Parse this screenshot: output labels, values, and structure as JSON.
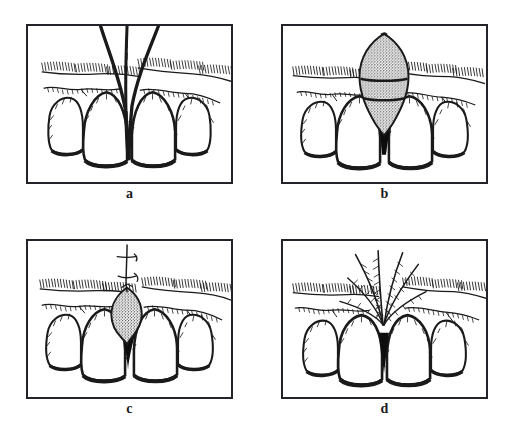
{
  "figure": {
    "background_color": "#ffffff",
    "ink_color": "#1a1a1a",
    "frame_color": "#23232a",
    "stipple_color": "#2b2b2b",
    "layout": "2x2 grid of framed line-drawing panels with bold serif captions below each panel"
  },
  "panels": [
    {
      "caption": "a",
      "name": "panel-a",
      "description": "Front view line drawing of four maxillary anterior teeth with a wide open interdental space between the two central incisors; two bold diverging curved lines mark the black triangle defect; hatched alveolar mucosa bands on both sides above the gingival margins.",
      "stage": "pre-operative open interdental space",
      "features": {
        "teeth_count": 4,
        "graft": false,
        "suture": false,
        "dark_interdental_triangle": true,
        "hatched_mucosa_bands": 2
      }
    },
    {
      "caption": "b",
      "name": "panel-b",
      "description": "A pointed oval stippled connective tissue graft positioned vertically in the interdental space, crossed by two horizontal dark bands dividing it into three segments; a solid black triangle lies at its base between the central incisors; hatched mucosa to the left and right.",
      "stage": "graft harvested and positioned",
      "features": {
        "teeth_count": 4,
        "graft": true,
        "graft_shape": "pointed oval spindle with two horizontal bands",
        "suture": false,
        "dark_interdental_triangle": true,
        "hatched_mucosa_bands": 2
      }
    },
    {
      "caption": "c",
      "name": "panel-c",
      "description": "A smaller teardrop stippled graft tucked into the interdental space, secured by a vertical suture thread with small cross stitch marks rising above the gingiva; solid black triangle beneath the graft; hatched mucosa bands on both sides.",
      "stage": "graft sutured in place",
      "features": {
        "teeth_count": 4,
        "graft": true,
        "graft_shape": "small teardrop",
        "suture": true,
        "dark_interdental_triangle": true,
        "hatched_mucosa_bands": 2
      }
    },
    {
      "caption": "d",
      "name": "panel-d",
      "description": "Healed result: a fan of radiating hatched strokes converges downward to the interdental site; the remaining interdental space appears as a narrow dark triangle between the central incisors; hatched mucosa bands flank the fan.",
      "stage": "healed result",
      "features": {
        "teeth_count": 4,
        "graft": false,
        "suture": false,
        "dark_interdental_triangle": true,
        "hatched_mucosa_bands": 2,
        "radiating_fan_strokes": true
      }
    }
  ]
}
